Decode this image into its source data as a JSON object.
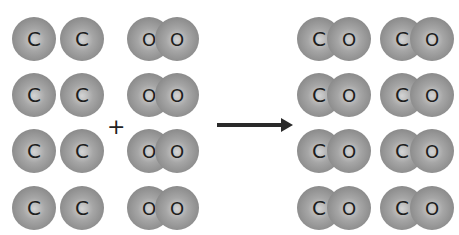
{
  "reaction": {
    "reactants": {
      "carbon_label": "C",
      "oxygen_label": "O",
      "carbon_atoms": 8,
      "oxygen_molecules": 4
    },
    "plus_symbol": "+",
    "products": {
      "molecule": "CO",
      "carbon_label": "C",
      "oxygen_label": "O",
      "count": 8
    }
  },
  "colors": {
    "atom_gray": "#8c8c8c",
    "label": "#1e1e1e",
    "arrow": "#2a2a2a"
  }
}
